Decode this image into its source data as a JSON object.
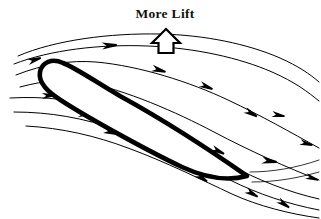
{
  "figure": {
    "title": "More Lift",
    "background_color": "#ffffff",
    "ink_color": "#000000"
  },
  "caption": {
    "label": "More Lift",
    "x": 165,
    "y": 18,
    "anchor": "middle"
  },
  "lift_arrow": {
    "name": "lift-arrow",
    "direction": "up",
    "style": "hollow-outline",
    "fill": "#ffffff",
    "stroke": "#000000",
    "bbox": {
      "x": 152,
      "y": 29,
      "width": 28,
      "height": 24
    },
    "path": "M 166 29 L 180 43 L 173.5 43 L 173.5 53 L 158.5 53 L 158.5 43 L 152 43 Z"
  },
  "airfoil": {
    "name": "airfoil",
    "description": "cambered airfoil at positive angle of attack, rounded leading edge upper-left, sharp trailing edge lower-right",
    "leading_edge": {
      "x": 52,
      "y": 74
    },
    "trailing_edge": {
      "x": 247,
      "y": 176
    },
    "stroke_width": 4.6,
    "path": "M 247 176 C 210 150 160 118 120 96 C 96 82 76 68 63 63 C 52 58 42 62 40 72 C 38 83 48 92 62 101 C 90 119 150 152 182 167 C 210 180 232 180 247 176 Z"
  },
  "streamlines": {
    "upper": [
      {
        "name": "streamline-upper-1",
        "path": "M 18 56 C 55 40 110 33 160 34 C 205 35 248 44 280 58 C 298 66 310 74 319 82"
      },
      {
        "name": "streamline-upper-2",
        "path": "M 14 64 C 50 50 100 44 148 46 C 196 48 240 58 272 72 C 295 82 308 92 319 101"
      },
      {
        "name": "streamline-upper-3",
        "path": "M 16 75 C 44 64 70 60 96 62 C 140 66 190 82 228 100 C 262 116 290 132 319 148"
      },
      {
        "name": "streamline-upper-4",
        "path": "M 20 87 C 46 80 66 79 84 82 C 126 90 176 112 214 132 C 250 151 288 168 319 180"
      }
    ],
    "lower": [
      {
        "name": "streamline-lower-1",
        "path": "M 10 98 C 46 96 78 100 110 110 C 150 123 194 146 228 164 C 258 180 288 192 319 199"
      },
      {
        "name": "streamline-lower-2",
        "path": "M 14 112 C 50 112 84 118 118 130 C 158 144 198 164 230 180 C 258 194 288 204 319 210"
      },
      {
        "name": "streamline-lower-3",
        "path": "M 26 126 C 62 128 96 136 128 148 C 166 162 202 180 232 194 C 258 206 290 214 319 218"
      }
    ],
    "wake": [
      {
        "name": "streamline-wake-1",
        "path": "M 250 172 C 272 172 296 168 319 160"
      },
      {
        "name": "streamline-wake-2",
        "path": "M 252 182 C 276 182 298 178 319 172"
      }
    ]
  },
  "flow_arrows": [
    {
      "name": "flow-arrow-inflow-upper",
      "x": 28,
      "y": 62,
      "angle": -18,
      "scale": 1.0
    },
    {
      "name": "flow-arrow-upper-front",
      "x": 102,
      "y": 46,
      "angle": -4,
      "scale": 1.1
    },
    {
      "name": "flow-arrow-upper-mid",
      "x": 152,
      "y": 68,
      "angle": 16,
      "scale": 1.05
    },
    {
      "name": "flow-arrow-upper-rear",
      "x": 200,
      "y": 84,
      "angle": 22,
      "scale": 1.0
    },
    {
      "name": "flow-arrow-upper-far",
      "x": 245,
      "y": 110,
      "angle": 28,
      "scale": 1.0
    },
    {
      "name": "flow-arrow-outer-right",
      "x": 272,
      "y": 114,
      "angle": 10,
      "scale": 0.95
    },
    {
      "name": "flow-arrow-inflow-mid",
      "x": 42,
      "y": 96,
      "angle": -4,
      "scale": 1.0
    },
    {
      "name": "flow-arrow-inflow-lower",
      "x": 78,
      "y": 114,
      "angle": 2,
      "scale": 1.0
    },
    {
      "name": "flow-arrow-lower-front",
      "x": 104,
      "y": 130,
      "angle": 18,
      "scale": 1.0
    },
    {
      "name": "flow-arrow-lower-mid",
      "x": 136,
      "y": 132,
      "angle": 16,
      "scale": 1.0
    },
    {
      "name": "flow-arrow-lower-rear",
      "x": 160,
      "y": 152,
      "angle": 28,
      "scale": 1.0
    },
    {
      "name": "flow-arrow-lower-aft",
      "x": 196,
      "y": 174,
      "angle": 34,
      "scale": 1.0
    },
    {
      "name": "flow-arrow-trailing-upper",
      "x": 212,
      "y": 148,
      "angle": 26,
      "scale": 1.0
    },
    {
      "name": "flow-arrow-wake-upper",
      "x": 262,
      "y": 160,
      "angle": 8,
      "scale": 1.1
    },
    {
      "name": "flow-arrow-wake-mid",
      "x": 246,
      "y": 190,
      "angle": 30,
      "scale": 1.0
    },
    {
      "name": "flow-arrow-wake-lower",
      "x": 278,
      "y": 200,
      "angle": 34,
      "scale": 1.0
    },
    {
      "name": "flow-arrow-right-edge",
      "x": 300,
      "y": 142,
      "angle": 14,
      "scale": 0.95
    },
    {
      "name": "flow-arrow-right-low",
      "x": 306,
      "y": 176,
      "angle": 18,
      "scale": 0.95
    }
  ]
}
